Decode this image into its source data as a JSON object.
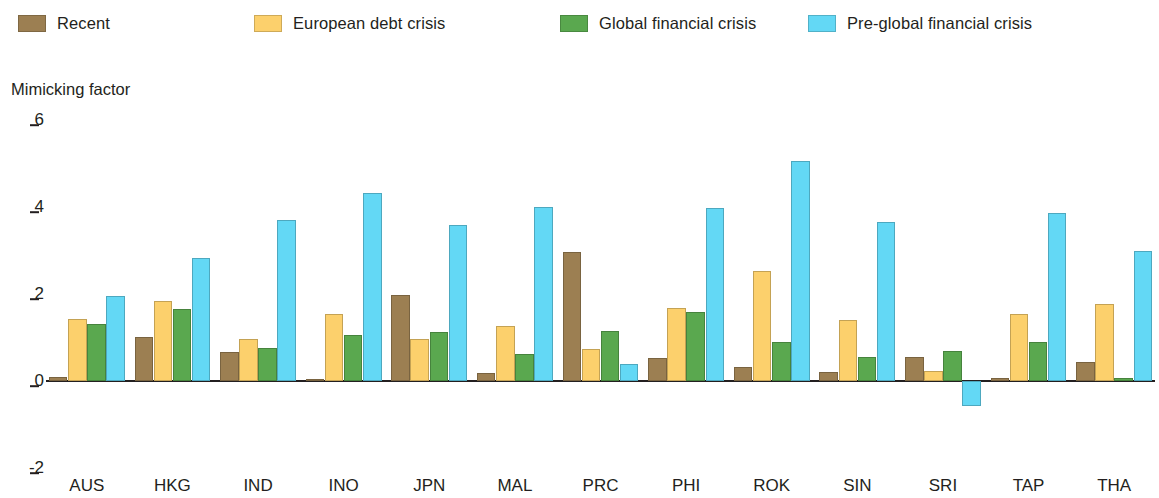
{
  "legend": {
    "items": [
      {
        "label": "Recent",
        "color": "#9c7f52"
      },
      {
        "label": "European debt crisis",
        "color": "#fcd06c"
      },
      {
        "label": "Global financial crisis",
        "color": "#5aa84f"
      },
      {
        "label": "Pre-global financial crisis",
        "color": "#63d8f5"
      }
    ]
  },
  "axis": {
    "y_title": "Mimicking factor",
    "y_ticks": [
      "6",
      "4",
      "2",
      "0",
      "-2"
    ]
  },
  "chart_data": {
    "type": "bar",
    "title": "",
    "subtitle": "",
    "xlabel": "",
    "ylabel": "Mimicking factor",
    "ylim": [
      -2,
      6
    ],
    "ytick_values": [
      6,
      4,
      2,
      0,
      -2
    ],
    "grid": false,
    "legend_position": "top-left",
    "categories": [
      "AUS",
      "HKG",
      "IND",
      "INO",
      "JPN",
      "MAL",
      "PRC",
      "PHI",
      "ROK",
      "SIN",
      "SRI",
      "TAP",
      "THA"
    ],
    "series": [
      {
        "name": "Recent",
        "color": "#9c7f52",
        "values": [
          0.1,
          1.01,
          0.67,
          0.05,
          1.98,
          0.18,
          2.97,
          0.53,
          0.32,
          0.21,
          0.55,
          0.08,
          0.44
        ]
      },
      {
        "name": "European debt crisis",
        "color": "#fcd06c",
        "values": [
          1.43,
          1.84,
          0.97,
          1.54,
          0.97,
          1.26,
          0.73,
          1.68,
          2.53,
          1.4,
          0.24,
          1.55,
          1.76
        ]
      },
      {
        "name": "Global financial crisis",
        "color": "#5aa84f",
        "values": [
          1.31,
          1.66,
          0.76,
          1.06,
          1.13,
          0.62,
          1.14,
          1.59,
          0.9,
          0.55,
          0.7,
          0.9,
          0.08
        ]
      },
      {
        "name": "Pre-global financial crisis",
        "color": "#63d8f5",
        "values": [
          1.95,
          2.83,
          3.7,
          4.32,
          3.59,
          3.99,
          0.4,
          3.98,
          5.06,
          3.66,
          -0.58,
          3.87,
          2.98
        ]
      }
    ]
  }
}
